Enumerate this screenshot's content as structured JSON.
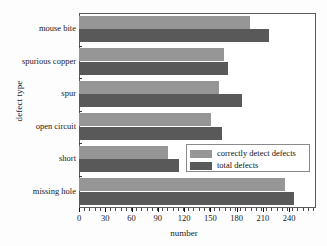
{
  "chart_data": {
    "type": "bar",
    "orientation": "horizontal",
    "title": "",
    "xlabel": "number",
    "ylabel": "defect type",
    "categories": [
      "missing hole",
      "short",
      "open circuit",
      "spur",
      "spurious copper",
      "mouse bite"
    ],
    "series": [
      {
        "name": "correctly detect defects",
        "color": "#969696",
        "values": [
          235,
          102,
          151,
          160,
          166,
          195
        ]
      },
      {
        "name": "total defects",
        "color": "#595959",
        "values": [
          246,
          114,
          163,
          186,
          170,
          217
        ]
      }
    ],
    "xlim": [
      0,
      240
    ],
    "xticks": [
      0,
      30,
      60,
      90,
      120,
      150,
      180,
      210,
      240
    ],
    "xtick_labels": [
      "0",
      "30",
      "60",
      "90",
      "120",
      "150",
      "180",
      "210",
      "240"
    ],
    "grid": false,
    "legend_position": "center-right",
    "legend_entries": [
      "correctly detect defects",
      "total defects"
    ]
  }
}
